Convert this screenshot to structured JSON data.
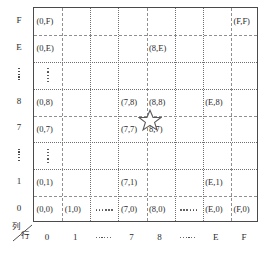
{
  "figure": {
    "kind": "coordinate-grid-diagram",
    "axis_caption": {
      "column": "列",
      "row": "行"
    },
    "row_axis_labels": [
      "F",
      "E",
      "⋮",
      "8",
      "7",
      "⋮",
      "1",
      "0"
    ],
    "col_axis_labels": [
      "0",
      "1",
      "……",
      "7",
      "8",
      "……",
      "E",
      "F"
    ],
    "marker": {
      "name": "star",
      "label": "★",
      "between_cells": [
        "(7,8)",
        "(8,8)",
        "(7,7)",
        "(8,7)"
      ]
    },
    "colors": {
      "border": "#4a4a4a",
      "gridline": "#8f8f8f",
      "text": "#2b2b2b",
      "background": "#ffffff"
    },
    "cells": [
      {
        "row": 0,
        "col": 0,
        "text": "(0,F)"
      },
      {
        "row": 0,
        "col": 7,
        "text": "(F,F)"
      },
      {
        "row": 1,
        "col": 0,
        "text": "(0,E)"
      },
      {
        "row": 1,
        "col": 4,
        "text": "(8,E)"
      },
      {
        "row": 3,
        "col": 0,
        "text": "(0,8)"
      },
      {
        "row": 3,
        "col": 3,
        "text": "(7,8)"
      },
      {
        "row": 3,
        "col": 4,
        "text": "(8,8)"
      },
      {
        "row": 3,
        "col": 6,
        "text": "(E,8)"
      },
      {
        "row": 4,
        "col": 0,
        "text": "(0,7)"
      },
      {
        "row": 4,
        "col": 3,
        "text": "(7,7)"
      },
      {
        "row": 4,
        "col": 4,
        "text": "8,7)"
      },
      {
        "row": 6,
        "col": 0,
        "text": "(0,1)"
      },
      {
        "row": 6,
        "col": 3,
        "text": "(7,1)"
      },
      {
        "row": 6,
        "col": 6,
        "text": "(E,1)"
      },
      {
        "row": 7,
        "col": 0,
        "text": "(0,0)"
      },
      {
        "row": 7,
        "col": 1,
        "text": "(1,0)"
      },
      {
        "row": 7,
        "col": 3,
        "text": "(7,0)"
      },
      {
        "row": 7,
        "col": 4,
        "text": "(8,0)"
      },
      {
        "row": 7,
        "col": 6,
        "text": "(E,0)"
      },
      {
        "row": 7,
        "col": 7,
        "text": "(F,0)"
      }
    ],
    "ellipsis_cells": [
      {
        "row": 2,
        "col": 0,
        "orientation": "vertical"
      },
      {
        "row": 5,
        "col": 0,
        "orientation": "vertical"
      },
      {
        "row": 7,
        "col": 2,
        "orientation": "horizontal"
      },
      {
        "row": 7,
        "col": 5,
        "orientation": "horizontal"
      }
    ]
  }
}
